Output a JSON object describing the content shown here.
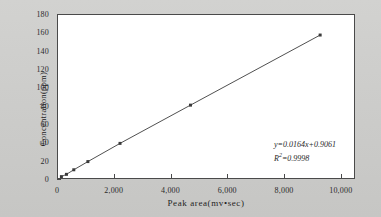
{
  "chart_data": {
    "type": "scatter",
    "title": "",
    "xlabel": "Peak area(mv•sec)",
    "ylabel": "Concentration(ppm)",
    "xlim": [
      0,
      10500
    ],
    "ylim": [
      0,
      180
    ],
    "xticks": [
      0,
      2000,
      4000,
      6000,
      8000,
      10000
    ],
    "xtick_labels": [
      "0",
      "2,000",
      "4,000",
      "6,000",
      "8,000",
      "10,000"
    ],
    "yticks": [
      0,
      20,
      40,
      60,
      80,
      100,
      120,
      140,
      160,
      180
    ],
    "ytick_labels": [
      "0",
      "20",
      "40",
      "60",
      "80",
      "100",
      "120",
      "140",
      "160",
      "180"
    ],
    "grid": false,
    "legend": null,
    "series": [
      {
        "name": "calibration",
        "marker": "filled-square",
        "marker_color": "#3a3a3a",
        "line_color": "#3a3a3a",
        "x": [
          120,
          300,
          560,
          1060,
          2200,
          4700,
          9300
        ],
        "y": [
          2.5,
          5.0,
          10.0,
          19.0,
          39.0,
          81.0,
          158.0
        ]
      }
    ],
    "fit": {
      "equation": "y=0.0164x+0.9061",
      "r_squared_label": "R",
      "r_squared_exponent": "2",
      "r_squared_value": "=0.9998",
      "slope": 0.0164,
      "intercept": 0.9061,
      "r_squared": 0.9998
    },
    "annotation_lines": [
      "y=0.0164x+0.9061",
      "R²=0.9998"
    ],
    "colors": {
      "plot_background": "#ffffff",
      "figure_background": "#cdcdcb",
      "axis": "#4a4a4a",
      "data": "#3a3a3a",
      "text": "#1f1f1f"
    }
  }
}
